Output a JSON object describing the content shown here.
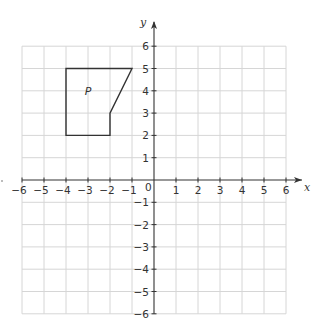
{
  "chart_data": {
    "type": "coordinate-grid",
    "title": "",
    "xlabel": "x",
    "ylabel": "y",
    "xlim": [
      -6,
      6
    ],
    "ylim": [
      -6,
      6
    ],
    "grid": true,
    "x_ticks": [
      -6,
      -5,
      -4,
      -3,
      -2,
      -1,
      1,
      2,
      3,
      4,
      5,
      6
    ],
    "y_ticks": [
      -6,
      -5,
      -4,
      -3,
      -2,
      -1,
      1,
      2,
      3,
      4,
      5,
      6
    ],
    "origin_label": "0",
    "shapes": [
      {
        "name": "P",
        "label": "P",
        "label_position": [
          -3,
          3.8
        ],
        "vertices": [
          [
            -4,
            5
          ],
          [
            -1,
            5
          ],
          [
            -2,
            3
          ],
          [
            -2,
            2
          ],
          [
            -4,
            2
          ]
        ]
      }
    ]
  },
  "colors": {
    "grid": "#d6d6d6",
    "axis": "#333333",
    "shape": "#333333",
    "text": "#333333"
  }
}
